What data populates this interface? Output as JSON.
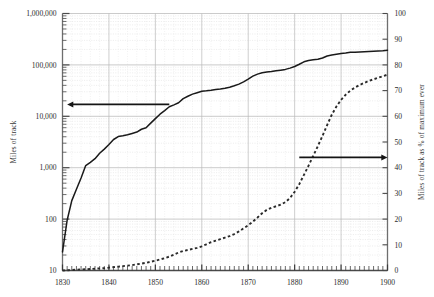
{
  "chart_data": {
    "type": "line",
    "title": "",
    "xlabel": "",
    "ylabel": "Miles of track",
    "y2label": "Miles of track as % of maximum ever",
    "grid": true,
    "legend": "none",
    "x_axis": {
      "min": 1830,
      "max": 1900,
      "tick_labels": [
        "1830",
        "1840",
        "1850",
        "1860",
        "1870",
        "1880",
        "1890",
        "1900"
      ],
      "tick_values": [
        1830,
        1840,
        1850,
        1860,
        1870,
        1880,
        1890,
        1900
      ],
      "minor_tick_step": 1
    },
    "y_left_axis": {
      "scale": "log",
      "min": 10,
      "max": 1000000,
      "tick_labels": [
        "10",
        "100",
        "1,000",
        "10,000",
        "100,000",
        "1,000,000"
      ],
      "tick_values": [
        10,
        100,
        1000,
        10000,
        100000,
        1000000
      ]
    },
    "y_right_axis": {
      "scale": "linear",
      "min": 0,
      "max": 100,
      "tick_labels": [
        "0",
        "10",
        "20",
        "30",
        "40",
        "50",
        "60",
        "70",
        "80",
        "90",
        "100"
      ],
      "tick_values": [
        0,
        10,
        20,
        30,
        40,
        50,
        60,
        70,
        80,
        90,
        100
      ]
    },
    "annotations": [
      {
        "name": "left-pointing-arrow",
        "text": "",
        "direction": "left",
        "axis": "left",
        "x_from": 1853,
        "x_to": 1831,
        "y_value": 17000
      },
      {
        "name": "right-pointing-arrow",
        "text": "",
        "direction": "right",
        "axis": "right",
        "x_from": 1881,
        "x_to": 1900,
        "y_value": 44
      }
    ],
    "series": [
      {
        "name": "Miles of track",
        "axis": "left",
        "style": "solid",
        "color": "#1a1a1a",
        "x": [
          1830,
          1831,
          1832,
          1833,
          1834,
          1835,
          1836,
          1837,
          1838,
          1839,
          1840,
          1841,
          1842,
          1843,
          1844,
          1845,
          1846,
          1847,
          1848,
          1849,
          1850,
          1851,
          1852,
          1853,
          1854,
          1855,
          1856,
          1857,
          1858,
          1859,
          1860,
          1861,
          1862,
          1863,
          1864,
          1865,
          1866,
          1867,
          1868,
          1869,
          1870,
          1871,
          1872,
          1873,
          1874,
          1875,
          1876,
          1877,
          1878,
          1879,
          1880,
          1881,
          1882,
          1883,
          1884,
          1885,
          1886,
          1887,
          1888,
          1889,
          1890,
          1891,
          1892,
          1893,
          1894,
          1895,
          1896,
          1897,
          1898,
          1899,
          1900
        ],
        "values": [
          23,
          95,
          229,
          380,
          633,
          1098,
          1273,
          1497,
          1913,
          2302,
          2818,
          3535,
          4026,
          4185,
          4377,
          4633,
          4930,
          5598,
          5996,
          7365,
          9021,
          10982,
          12908,
          15360,
          16720,
          18374,
          22076,
          24503,
          26968,
          28789,
          30626,
          31286,
          32120,
          33170,
          33908,
          35085,
          36801,
          39250,
          42229,
          46844,
          52922,
          60301,
          66171,
          70268,
          72385,
          74096,
          76808,
          79082,
          81747,
          86556,
          93262,
          103108,
          114677,
          121422,
          125345,
          128320,
          136338,
          149214,
          156082,
          161276,
          166703,
          170601,
          175690,
          176461,
          178709,
          180657,
          182777,
          184428,
          186396,
          189295,
          193346
        ]
      },
      {
        "name": "Miles of track as % of maximum ever",
        "axis": "right",
        "style": "dotted",
        "color": "#2a2a2a",
        "x": [
          1830,
          1831,
          1832,
          1833,
          1834,
          1835,
          1836,
          1837,
          1838,
          1839,
          1840,
          1841,
          1842,
          1843,
          1844,
          1845,
          1846,
          1847,
          1848,
          1849,
          1850,
          1851,
          1852,
          1853,
          1854,
          1855,
          1856,
          1857,
          1858,
          1859,
          1860,
          1861,
          1862,
          1863,
          1864,
          1865,
          1866,
          1867,
          1868,
          1869,
          1870,
          1871,
          1872,
          1873,
          1874,
          1875,
          1876,
          1877,
          1878,
          1879,
          1880,
          1881,
          1882,
          1883,
          1884,
          1885,
          1886,
          1887,
          1888,
          1889,
          1890,
          1891,
          1892,
          1893,
          1894,
          1895,
          1896,
          1897,
          1898,
          1899,
          1900
        ],
        "values": [
          0.0,
          0.1,
          0.2,
          0.3,
          0.4,
          0.5,
          0.6,
          0.7,
          0.8,
          0.9,
          1.1,
          1.3,
          1.5,
          1.7,
          1.9,
          2.1,
          2.4,
          2.7,
          3.0,
          3.4,
          3.8,
          4.3,
          4.8,
          5.4,
          6.2,
          7.0,
          7.6,
          8.0,
          8.4,
          8.8,
          9.4,
          10.2,
          11.0,
          11.6,
          12.2,
          12.8,
          13.4,
          14.2,
          15.2,
          16.4,
          17.6,
          19.0,
          20.6,
          22.3,
          23.6,
          24.4,
          25.0,
          25.6,
          26.6,
          28.2,
          30.6,
          33.6,
          37.2,
          40.8,
          44.6,
          48.4,
          52.4,
          56.6,
          60.6,
          63.8,
          66.4,
          68.4,
          70.0,
          71.2,
          72.2,
          73.0,
          73.8,
          74.4,
          75.0,
          75.6,
          76.2
        ]
      }
    ]
  }
}
